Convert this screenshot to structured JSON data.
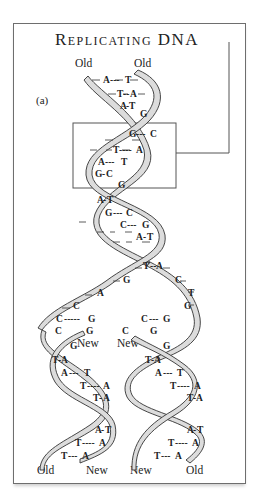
{
  "title": "Replicating DNA",
  "panel_label": "(a)",
  "top_labels": {
    "left": "Old",
    "right": "Old"
  },
  "fork_labels": {
    "left_new": "New",
    "right_new": "New"
  },
  "bottom_labels": [
    "Old",
    "New",
    "New",
    "Old"
  ],
  "parent_base_pairs": [
    {
      "left": "A",
      "right": "T"
    },
    {
      "left": "T",
      "right": "A"
    },
    {
      "left": "A",
      "right": "T"
    },
    {
      "left": "",
      "right": "G"
    },
    {
      "left": "G",
      "right": "C"
    },
    {
      "left": "T",
      "right": "A"
    },
    {
      "left": "A",
      "right": "T"
    },
    {
      "left": "G",
      "right": "C"
    },
    {
      "left": "",
      "right": "G"
    },
    {
      "left": "A",
      "right": "T"
    },
    {
      "left": "G",
      "right": "C"
    },
    {
      "left": "C",
      "right": "G"
    },
    {
      "left": "A",
      "right": "T"
    },
    {
      "left": "T",
      "right": "A"
    }
  ],
  "fork_bases": {
    "left_strand": [
      "G",
      "A",
      "C",
      "C",
      "C"
    ],
    "right_strand": [
      "C",
      "T",
      "G",
      "G",
      "G"
    ],
    "left_new_pairs": [
      {
        "old": "C",
        "new": "G"
      },
      {
        "old": "C",
        "new": "G"
      }
    ],
    "right_new_pairs": [
      {
        "old": "G",
        "new": "C"
      },
      {
        "old": "G",
        "new": "C"
      }
    ]
  },
  "daughter_left_pairs": [
    {
      "left": "",
      "right": "G"
    },
    {
      "left": "T",
      "right": "A"
    },
    {
      "left": "A",
      "right": "T"
    },
    {
      "left": "T",
      "right": "A"
    },
    {
      "left": "T",
      "right": "A"
    },
    {
      "left": "A",
      "right": "T"
    },
    {
      "left": "T",
      "right": "A"
    },
    {
      "left": "T",
      "right": "A"
    }
  ],
  "daughter_right_pairs": [
    {
      "left": "",
      "right": "G"
    },
    {
      "left": "T",
      "right": "A"
    },
    {
      "left": "A",
      "right": "T"
    },
    {
      "left": "T",
      "right": "A"
    },
    {
      "left": "T",
      "right": "A"
    },
    {
      "left": "A",
      "right": "T"
    },
    {
      "left": "T",
      "right": "A"
    },
    {
      "left": "T",
      "right": "A"
    }
  ],
  "colors": {
    "line": "#333333",
    "ribbon_fill": "#dcdcdc",
    "frame": "#6e6e6e"
  }
}
